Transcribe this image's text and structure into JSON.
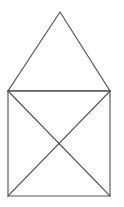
{
  "figure": {
    "name": "house-shape-line-drawing",
    "background_color": "#ffffff",
    "stroke_color": "#555555",
    "stroke_width": 1.15,
    "canvas": {
      "width": 124,
      "height": 207
    },
    "vertices": {
      "apex": {
        "x": 60,
        "y": 12
      },
      "square_top_left": {
        "x": 8,
        "y": 91
      },
      "square_top_right": {
        "x": 110,
        "y": 91
      },
      "square_bottom_left": {
        "x": 8,
        "y": 196
      },
      "square_bottom_right": {
        "x": 110,
        "y": 196
      },
      "diagonal_intersection": {
        "x": 59,
        "y": 143.5
      }
    },
    "shapes": [
      {
        "id": "roof-triangle",
        "label": "Triangle",
        "points": "60,12 110,91 8,91"
      },
      {
        "id": "body-square",
        "label": "Square",
        "points": "8,91 110,91 110,196 8,196"
      }
    ],
    "segments": [
      {
        "id": "triangle-left-edge",
        "label": "Triangle left edge",
        "x1": 60,
        "y1": 12,
        "x2": 8,
        "y2": 91
      },
      {
        "id": "triangle-right-edge",
        "label": "Triangle right edge",
        "x1": 60,
        "y1": 12,
        "x2": 110,
        "y2": 91
      },
      {
        "id": "square-top-edge",
        "label": "Square top edge",
        "x1": 8,
        "y1": 91,
        "x2": 110,
        "y2": 91
      },
      {
        "id": "square-left-edge",
        "label": "Square left edge",
        "x1": 8,
        "y1": 91,
        "x2": 8,
        "y2": 196
      },
      {
        "id": "square-right-edge",
        "label": "Square right edge",
        "x1": 110,
        "y1": 91,
        "x2": 110,
        "y2": 196
      },
      {
        "id": "square-bottom-edge",
        "label": "Square bottom edge",
        "x1": 8,
        "y1": 196,
        "x2": 110,
        "y2": 196
      },
      {
        "id": "diagonal-tl-br",
        "label": "Diagonal top-left to bottom-right",
        "x1": 8,
        "y1": 91,
        "x2": 110,
        "y2": 196
      },
      {
        "id": "diagonal-tr-bl",
        "label": "Diagonal top-right to bottom-left",
        "x1": 110,
        "y1": 91,
        "x2": 8,
        "y2": 196
      }
    ]
  }
}
